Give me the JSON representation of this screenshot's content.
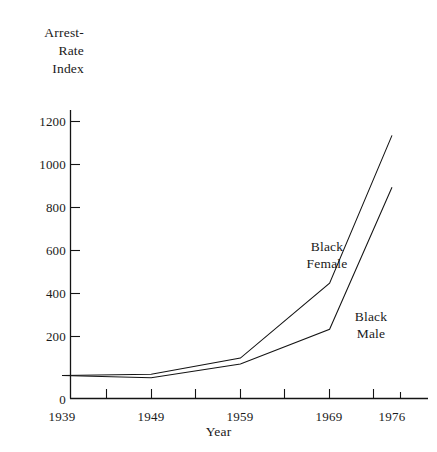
{
  "chart_data": {
    "type": "line",
    "title": "",
    "xlabel": "Year",
    "ylabel": "Arrest-\nRate\nIndex",
    "x": [
      1939,
      1949,
      1959,
      1969,
      1976
    ],
    "xticklabels": [
      "1939",
      "1949",
      "1959",
      "1969",
      "1976"
    ],
    "yticklabels": [
      "0",
      "200",
      "400",
      "600",
      "800",
      "1000",
      "1200"
    ],
    "yticks": [
      0,
      200,
      400,
      600,
      800,
      1000,
      1200
    ],
    "xlim": [
      1939,
      1976
    ],
    "ylim": [
      0,
      1300
    ],
    "grid": false,
    "legend": "inline-annotations",
    "series": [
      {
        "name": "Black Female",
        "label_text": "Black\nFemale",
        "color": "#141414",
        "values": [
          100,
          105,
          175,
          500,
          1140
        ]
      },
      {
        "name": "Black Male",
        "label_text": "Black\nMale",
        "color": "#141414",
        "values": [
          100,
          90,
          150,
          300,
          915
        ]
      }
    ]
  },
  "axes": {
    "y_title": "Arrest-\nRate\nIndex",
    "x_title": "Year",
    "y_ticks": [
      {
        "label": "1200"
      },
      {
        "label": "1000"
      },
      {
        "label": "800"
      },
      {
        "label": "600"
      },
      {
        "label": "400"
      },
      {
        "label": "200"
      },
      {
        "label": "0"
      }
    ],
    "x_ticks": [
      {
        "label": "1939"
      },
      {
        "label": "1949"
      },
      {
        "label": "1959"
      },
      {
        "label": "1969"
      },
      {
        "label": "1976"
      }
    ]
  },
  "annotations": {
    "black_female": "Black\nFemale",
    "black_male": "Black\nMale"
  },
  "colors": {
    "ink": "#141414",
    "background": "#ffffff"
  }
}
